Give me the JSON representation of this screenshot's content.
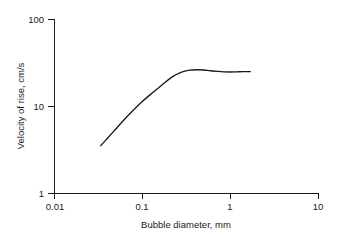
{
  "chart_data": {
    "type": "line",
    "title": "",
    "xlabel": "Bubble diameter, mm",
    "ylabel": "Velocity of rise, cm/s",
    "xscale": "log",
    "yscale": "log",
    "xlim": [
      0.01,
      10
    ],
    "ylim": [
      1,
      100
    ],
    "grid": false,
    "legend": false,
    "xticks": [
      0.01,
      0.1,
      1,
      10
    ],
    "xticklabels": [
      "0.01",
      "0.1",
      "1",
      "10"
    ],
    "yticks": [
      1,
      10,
      100
    ],
    "yticklabels": [
      "1",
      "10",
      "100"
    ],
    "series": [
      {
        "name": "Velocity of rise",
        "color": "#1a1a1a",
        "x": [
          0.034,
          0.04,
          0.05,
          0.063,
          0.08,
          0.1,
          0.125,
          0.15,
          0.175,
          0.2,
          0.23,
          0.265,
          0.3,
          0.35,
          0.42,
          0.5,
          0.6,
          0.72,
          0.85,
          1.0,
          1.2,
          1.4,
          1.7
        ],
        "y": [
          3.5,
          4.2,
          5.4,
          7.0,
          9.0,
          11.2,
          13.6,
          15.8,
          18.0,
          20.1,
          22.2,
          23.9,
          25.0,
          25.8,
          26.1,
          25.9,
          25.4,
          25.0,
          24.7,
          24.6,
          24.7,
          24.8,
          24.8
        ]
      }
    ]
  },
  "axes": {
    "x_title": "Bubble diameter, mm",
    "y_title": "Velocity of rise, cm/s"
  },
  "colors": {
    "ink": "#1a1a1a",
    "background": "#ffffff"
  }
}
